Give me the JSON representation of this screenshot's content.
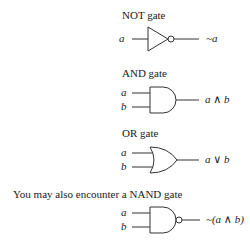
{
  "gates": {
    "not": {
      "title": "NOT gate",
      "input_a": "a",
      "output": "~a"
    },
    "and": {
      "title": "AND gate",
      "input_a": "a",
      "input_b": "b",
      "output": "a ∧ b"
    },
    "or": {
      "title": "OR gate",
      "input_a": "a",
      "input_b": "b",
      "output": "a ∨ b"
    },
    "nand": {
      "intro": "You may also encounter a NAND gate",
      "input_a": "a",
      "input_b": "b",
      "output": "~(a ∧ b)"
    }
  },
  "colors": {
    "stroke": "#333333",
    "text": "#1a1a1a",
    "background": "#ffffff"
  }
}
